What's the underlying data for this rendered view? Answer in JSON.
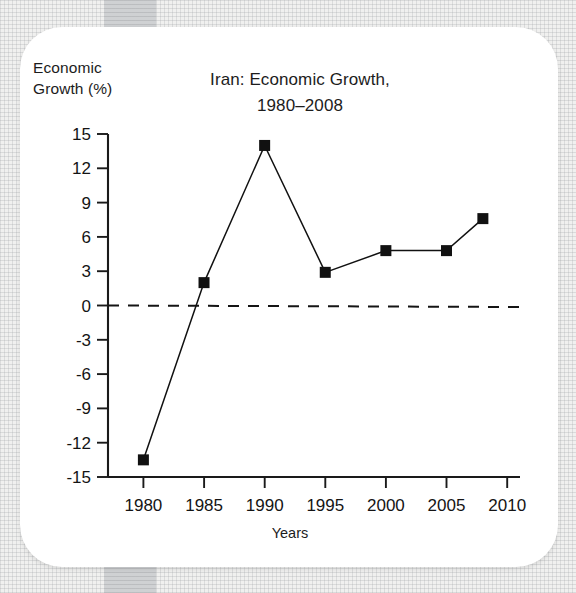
{
  "figure": {
    "title_line1": "Iran: Economic Growth,",
    "title_line2": "1980–2008",
    "y_axis_label": "Economic\nGrowth (%)",
    "x_axis_label": "Years"
  },
  "chart_data": {
    "type": "line",
    "title": "Iran: Economic Growth, 1980–2008",
    "xlabel": "Years",
    "ylabel": "Economic Growth (%)",
    "x": [
      1980,
      1985,
      1990,
      1995,
      2000,
      2005,
      2008
    ],
    "values": [
      -13.5,
      2.0,
      14.0,
      2.9,
      4.8,
      4.8,
      7.6
    ],
    "series": [
      {
        "name": "Iran economic growth",
        "values": [
          -13.5,
          2.0,
          14.0,
          2.9,
          4.8,
          4.8,
          7.6
        ]
      }
    ],
    "xlim": [
      1978,
      2012
    ],
    "ylim": [
      -15,
      15
    ],
    "xticks": [
      1980,
      1985,
      1990,
      1995,
      2000,
      2005,
      2010
    ],
    "xtick_labels": [
      "1980",
      "1985",
      "1990",
      "1995",
      "2000",
      "2005",
      "2010"
    ],
    "yticks": [
      15,
      12,
      9,
      6,
      3,
      0,
      -3,
      -6,
      -9,
      -12,
      -15
    ],
    "ytick_labels": [
      "15",
      "12",
      "9",
      "6",
      "3",
      "0",
      "-3",
      "-6",
      "-9",
      "-12",
      "-15"
    ],
    "grid": false,
    "legend": "none",
    "reference_line": {
      "y": 0,
      "style": "dashed",
      "color": "#111111"
    },
    "marker": {
      "shape": "square",
      "color": "#111111",
      "size": 11
    },
    "line": {
      "color": "#111111",
      "width": 1.4
    },
    "colors": {
      "ink": "#111111",
      "card": "#ffffff",
      "page": "#f0f0ef",
      "band": "#cfd1d3"
    }
  }
}
